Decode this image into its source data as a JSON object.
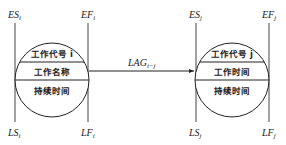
{
  "diagram": {
    "type": "precedence-network-node-pair",
    "link": {
      "label": "LAG",
      "subscript": "i−j"
    },
    "nodes": [
      {
        "id": "i",
        "es": {
          "label": "ES",
          "sub": "i"
        },
        "ef": {
          "label": "EF",
          "sub": "i"
        },
        "ls": {
          "label": "LS",
          "sub": "i"
        },
        "lf": {
          "label": "LF",
          "sub": "i"
        },
        "row1": "工作代号 i",
        "row2": "工作名称",
        "row3": "持续时间"
      },
      {
        "id": "j",
        "es": {
          "label": "ES",
          "sub": "j"
        },
        "ef": {
          "label": "EF",
          "sub": "j"
        },
        "ls": {
          "label": "LS",
          "sub": "j"
        },
        "lf": {
          "label": "LF",
          "sub": "j"
        },
        "row1": "工作代号 j",
        "row2": "工作时间",
        "row3": "持续时间"
      }
    ]
  }
}
